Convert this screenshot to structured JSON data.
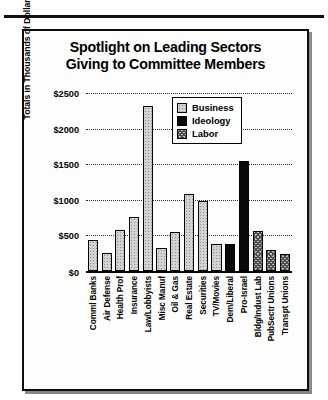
{
  "figure": {
    "title_line1": "Spotlight on Leading Sectors",
    "title_line2": "Giving to Committee Members"
  },
  "chart_data": {
    "type": "bar",
    "title": "Spotlight on Leading Sectors Giving to Committee Members",
    "xlabel": "",
    "ylabel": "Totals in Thousands of Dollars",
    "ylim": [
      0,
      2500
    ],
    "yticks": [
      0,
      500,
      1000,
      1500,
      2000,
      2500
    ],
    "ytick_labels": [
      "$0",
      "$500",
      "$1000",
      "$1500",
      "$2000",
      "$2500"
    ],
    "grid": true,
    "legend_position": "upper-center-right",
    "legend": [
      {
        "name": "Business",
        "fill": "light-dotted"
      },
      {
        "name": "Ideology",
        "fill": "solid-black"
      },
      {
        "name": "Labor",
        "fill": "dark-checker"
      }
    ],
    "categories": [
      "Comml Banks",
      "Air Defense",
      "Health Prof",
      "Insurance",
      "Law/Lobbyists",
      "Misc Manuf",
      "Oil & Gas",
      "Real Estate",
      "Securities",
      "TV/Movies",
      "Dem/Liberal",
      "Pro-Israel",
      "Bldg/Indust Lab",
      "PubSectr Unions",
      "Transpt Unions"
    ],
    "values": [
      430,
      260,
      580,
      760,
      2320,
      320,
      545,
      1075,
      985,
      380,
      380,
      1540,
      560,
      300,
      240
    ],
    "group_by_category": [
      "Business",
      "Business",
      "Business",
      "Business",
      "Business",
      "Business",
      "Business",
      "Business",
      "Business",
      "Business",
      "Ideology",
      "Ideology",
      "Labor",
      "Labor",
      "Labor"
    ]
  },
  "colors": {
    "ink": "#000000",
    "paper": "#ffffff",
    "business": "#d2d2d2",
    "ideology": "#0a0a0a",
    "labor": "#bdbdbd"
  }
}
